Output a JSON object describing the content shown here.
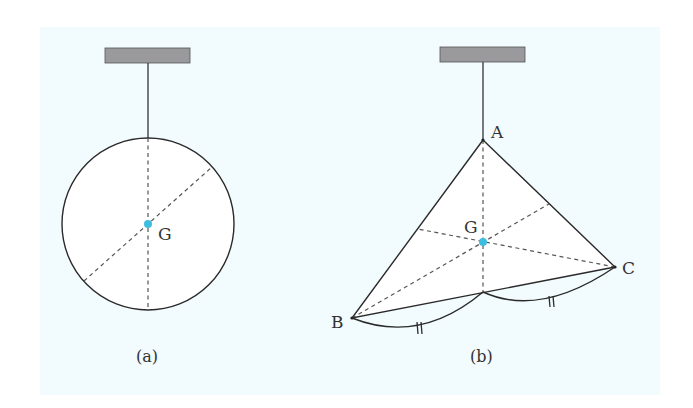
{
  "figure": {
    "background_color": "#f2fbfd",
    "accent_color": "#3fbde0",
    "panels": [
      {
        "id": "a",
        "caption": "(a)",
        "shape": "circle",
        "labels": {
          "centroid": "G"
        }
      },
      {
        "id": "b",
        "caption": "(b)",
        "shape": "triangle",
        "labels": {
          "vertex_top": "A",
          "vertex_left": "B",
          "vertex_right": "C",
          "centroid": "G"
        },
        "equal_marks": [
          "||",
          "||"
        ]
      }
    ]
  }
}
